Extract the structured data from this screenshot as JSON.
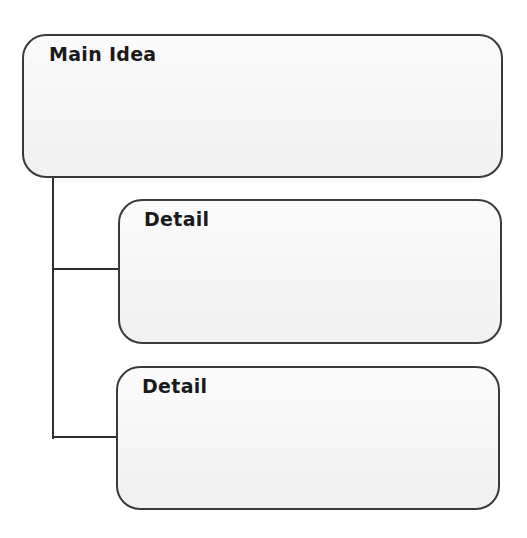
{
  "organizer": {
    "main_idea": {
      "title": "Main Idea"
    },
    "details": [
      {
        "title": "Detail"
      },
      {
        "title": "Detail"
      }
    ]
  },
  "colors": {
    "border": "#3a3a3a",
    "connector": "#2e2e2e",
    "box_fill": "#f4f4f4",
    "text": "#1a1a1a"
  }
}
